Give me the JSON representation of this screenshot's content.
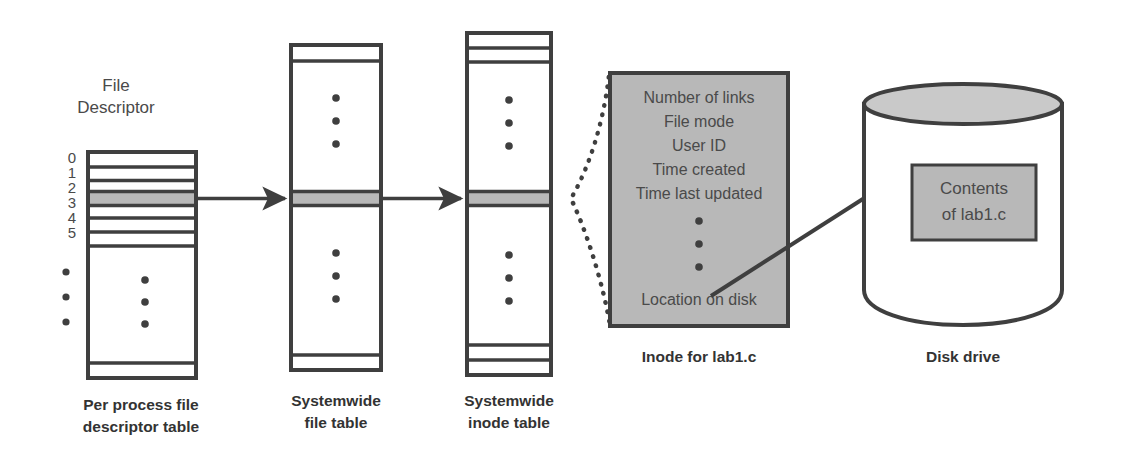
{
  "colors": {
    "stroke": "#3f3f3f",
    "gray_fill": "#b8b8b8",
    "gray_light": "#c9c9c9",
    "text": "#4a4a4a",
    "caption": "#333333",
    "white": "#ffffff"
  },
  "fd_table": {
    "heading_line1": "File",
    "heading_line2": "Descriptor",
    "row_numbers": [
      "0",
      "1",
      "2",
      "3",
      "4",
      "5"
    ],
    "ellipsis_left": "•••",
    "ellipsis_inside": "•••",
    "highlight_row_index": 3,
    "caption_line1": "Per process file",
    "caption_line2": "descriptor table"
  },
  "file_table": {
    "caption_line1": "Systemwide",
    "caption_line2": "file table",
    "ellipsis_top": "•••",
    "ellipsis_bottom": "•••"
  },
  "inode_table": {
    "caption_line1": "Systemwide",
    "caption_line2": "inode table",
    "ellipsis_top": "•••",
    "ellipsis_bottom": "•••"
  },
  "inode_detail": {
    "fields": [
      "Number of links",
      "File mode",
      "User ID",
      "Time created",
      "Time last updated"
    ],
    "ellipsis": "•••",
    "last_field": "Location on disk",
    "caption": "Inode for lab1.c"
  },
  "disk": {
    "contents_line1": "Contents",
    "contents_line2": "of lab1.c",
    "caption": "Disk drive"
  }
}
